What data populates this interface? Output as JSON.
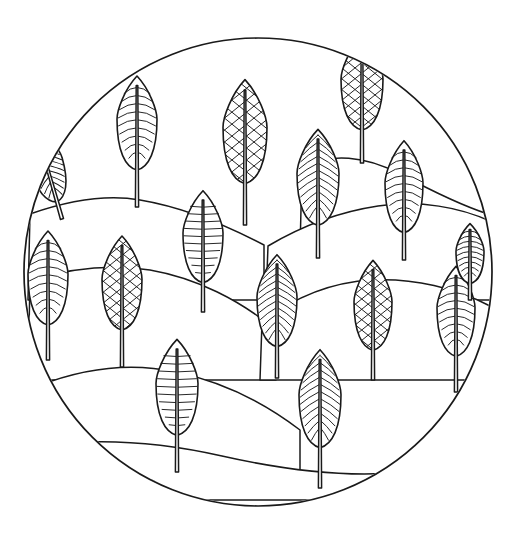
{
  "artwork": {
    "title": "Circular Landscape Coloring Page",
    "description": "Black line-art mandala: layered rolling hills with stylized leaf-shaped trees inside a circle",
    "style": "line-art",
    "background_color": "#ffffff",
    "ink_color": "#1a1a1a",
    "canvas": {
      "width": 518,
      "height": 550
    },
    "frame": {
      "shape": "circle",
      "center_x": 258,
      "center_y": 272,
      "radius": 234
    },
    "counts": {
      "trees": 16,
      "hill_bands": 7
    }
  },
  "hills": [
    {
      "id": "hill-1",
      "label": "Far ridge right",
      "path": "M 302 168 C 330 152 366 156 400 174 C 432 191 460 205 488 214 L 492 250 L 300 250 Z"
    },
    {
      "id": "hill-2",
      "label": "Upper left ridge",
      "path": "M 30 214 C 70 200 106 194 140 200 C 182 207 222 223 264 245 L 264 300 L 28 300 Z"
    },
    {
      "id": "hill-3",
      "label": "Mid right slope",
      "path": "M 268 246 C 300 227 338 212 378 206 C 420 200 460 207 492 222 L 492 300 L 266 300 Z"
    },
    {
      "id": "hill-4",
      "label": "Mid left slope",
      "path": "M 30 280 C 72 268 112 264 150 270 C 196 278 240 300 276 330 L 276 380 L 28 380 Z"
    },
    {
      "id": "hill-5",
      "label": "Right middle rise",
      "path": "M 262 322 C 296 296 334 282 372 280 C 414 278 456 288 490 306 L 490 380 L 260 380 Z"
    },
    {
      "id": "hill-6",
      "label": "Lower left mound",
      "path": "M 38 386 C 84 368 130 362 176 372 C 224 382 266 404 300 430 L 300 480 L 36 480 Z"
    },
    {
      "id": "hill-7",
      "label": "Foreground valley",
      "path": "M 40 446 C 96 438 160 442 222 456 C 284 470 346 478 404 472 C 440 468 468 458 488 446 L 488 500 L 38 500 Z"
    }
  ],
  "trees": [
    {
      "id": "tree-01",
      "name": "tree-upper-left-edge",
      "pattern": "diagonal-hatch",
      "cx": 62,
      "base_y": 219,
      "leaf_h": 76,
      "leaf_w": 34,
      "trunk_h": 30,
      "tilt": -16,
      "clipped": true
    },
    {
      "id": "tree-02",
      "name": "tree-upper-left",
      "pattern": "chevron",
      "cx": 137,
      "base_y": 207,
      "leaf_h": 94,
      "leaf_w": 40,
      "trunk_h": 52,
      "tilt": 0,
      "clipped": false
    },
    {
      "id": "tree-03",
      "name": "tree-upper-center",
      "pattern": "crosshatch",
      "cx": 245,
      "base_y": 225,
      "leaf_h": 104,
      "leaf_w": 44,
      "trunk_h": 58,
      "tilt": 0,
      "clipped": false
    },
    {
      "id": "tree-04",
      "name": "tree-upper-right",
      "pattern": "crosshatch",
      "cx": 362,
      "base_y": 163,
      "leaf_h": 94,
      "leaf_w": 42,
      "trunk_h": 48,
      "tilt": 0,
      "clipped": false
    },
    {
      "id": "tree-05",
      "name": "tree-mid-center",
      "pattern": "diagonal-hatch",
      "cx": 318,
      "base_y": 258,
      "leaf_h": 96,
      "leaf_w": 42,
      "trunk_h": 48,
      "tilt": 0,
      "clipped": false
    },
    {
      "id": "tree-06",
      "name": "tree-mid-right",
      "pattern": "chevron",
      "cx": 404,
      "base_y": 260,
      "leaf_h": 92,
      "leaf_w": 38,
      "trunk_h": 42,
      "tilt": 0,
      "clipped": false
    },
    {
      "id": "tree-07",
      "name": "tree-mid-left-center",
      "pattern": "horizontal-arc",
      "cx": 203,
      "base_y": 312,
      "leaf_h": 92,
      "leaf_w": 40,
      "trunk_h": 44,
      "tilt": 0,
      "clipped": false
    },
    {
      "id": "tree-08",
      "name": "tree-left-lower",
      "pattern": "chevron",
      "cx": 48,
      "base_y": 360,
      "leaf_h": 94,
      "leaf_w": 40,
      "trunk_h": 50,
      "tilt": 0,
      "clipped": false
    },
    {
      "id": "tree-09",
      "name": "tree-left-crosshatch",
      "pattern": "crosshatch",
      "cx": 122,
      "base_y": 367,
      "leaf_h": 94,
      "leaf_w": 40,
      "trunk_h": 52,
      "tilt": 0,
      "clipped": false
    },
    {
      "id": "tree-10",
      "name": "tree-center-lower",
      "pattern": "diagonal-hatch",
      "cx": 277,
      "base_y": 378,
      "leaf_h": 92,
      "leaf_w": 40,
      "trunk_h": 46,
      "tilt": 0,
      "clipped": false
    },
    {
      "id": "tree-11",
      "name": "tree-right-crosshatch",
      "pattern": "crosshatch",
      "cx": 373,
      "base_y": 380,
      "leaf_h": 90,
      "leaf_w": 38,
      "trunk_h": 44,
      "tilt": 0,
      "clipped": false
    },
    {
      "id": "tree-12",
      "name": "tree-far-right",
      "pattern": "chevron",
      "cx": 456,
      "base_y": 392,
      "leaf_h": 90,
      "leaf_w": 38,
      "trunk_h": 50,
      "tilt": 0,
      "clipped": false
    },
    {
      "id": "tree-13",
      "name": "tree-bottom-left",
      "pattern": "horizontal-arc",
      "cx": 177,
      "base_y": 472,
      "leaf_h": 96,
      "leaf_w": 42,
      "trunk_h": 52,
      "tilt": 0,
      "clipped": false
    },
    {
      "id": "tree-14",
      "name": "tree-bottom-center",
      "pattern": "diagonal-hatch",
      "cx": 320,
      "base_y": 488,
      "leaf_h": 98,
      "leaf_w": 42,
      "trunk_h": 56,
      "tilt": 0,
      "clipped": false
    },
    {
      "id": "tree-15",
      "name": "tree-top-right-small",
      "pattern": "chevron",
      "cx": 470,
      "base_y": 300,
      "leaf_h": 60,
      "leaf_w": 28,
      "trunk_h": 26,
      "tilt": 0,
      "clipped": true
    },
    {
      "id": "tree-16",
      "name": "tree-upper-mid-right",
      "pattern": "diagonal-hatch",
      "cx": 325,
      "base_y": 258,
      "leaf_h": 0,
      "leaf_w": 0,
      "trunk_h": 0,
      "tilt": 0,
      "clipped": true
    }
  ],
  "patterns": {
    "chevron": "Nested V-shaped vein arcs rising toward the tip",
    "crosshatch": "Diamond lattice of crossing diagonal lines",
    "diagonal-hatch": "Parallel slanted veins angling up from the midrib",
    "horizontal-arc": "Stacked horizontal curved bands across the leaf"
  },
  "captions": {
    "top": "",
    "bottom": ""
  }
}
